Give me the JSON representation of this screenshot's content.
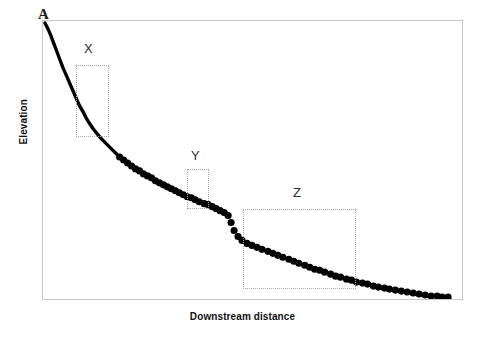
{
  "figure": {
    "panel_label": "A",
    "width": 485,
    "height": 337,
    "background_color": "#ffffff",
    "frame_color": "#c9c9c9"
  },
  "axes": {
    "x_title": "Downstream distance",
    "y_title": "Elevation"
  },
  "annotations": {
    "boxes": [
      {
        "label": "X",
        "x": 75,
        "y": 64,
        "width": 33,
        "height": 72,
        "label_x": 83,
        "label_y": 41
      },
      {
        "label": "Y",
        "x": 186,
        "y": 168,
        "width": 22,
        "height": 40,
        "label_x": 190,
        "label_y": 148
      },
      {
        "label": "Z",
        "x": 242,
        "y": 208,
        "width": 113,
        "height": 80,
        "label_x": 292,
        "label_y": 185
      }
    ],
    "box_line_color": "#a8a8a8",
    "box_line_style": "dotted"
  },
  "chart_data": {
    "type": "line",
    "title": "",
    "subtitle": "",
    "xlabel": "Downstream distance",
    "ylabel": "Elevation",
    "xlim": [
      0,
      421
    ],
    "ylim": [
      0,
      280
    ],
    "grid": false,
    "legend": null,
    "axis_ticks": {
      "x": [],
      "y": []
    },
    "marker_color": "#000000",
    "line_color": "#000000",
    "marker_size": 3.6,
    "line_width": 3.4,
    "solid_segment": {
      "style": "solid-line",
      "points": [
        [
          2,
          2
        ],
        [
          5,
          8
        ],
        [
          8,
          15
        ],
        [
          11,
          23
        ],
        [
          14,
          31
        ],
        [
          17,
          39
        ],
        [
          20,
          47
        ],
        [
          24,
          56
        ],
        [
          27,
          63
        ],
        [
          30,
          70
        ],
        [
          33,
          77
        ],
        [
          36,
          84
        ],
        [
          40,
          91
        ],
        [
          43,
          97
        ],
        [
          46,
          102
        ],
        [
          50,
          108
        ],
        [
          54,
          113
        ],
        [
          58,
          118
        ],
        [
          62,
          122
        ],
        [
          66,
          126
        ],
        [
          70,
          130
        ],
        [
          74,
          134
        ]
      ]
    },
    "dotted_segment": {
      "style": "markers",
      "points": [
        [
          77,
          137
        ],
        [
          81,
          140
        ],
        [
          85,
          143
        ],
        [
          89,
          146
        ],
        [
          93,
          149
        ],
        [
          97,
          151
        ],
        [
          101,
          154
        ],
        [
          105,
          156
        ],
        [
          109,
          158
        ],
        [
          113,
          161
        ],
        [
          117,
          163
        ],
        [
          121,
          165
        ],
        [
          125,
          167
        ],
        [
          129,
          169
        ],
        [
          133,
          171
        ],
        [
          137,
          173
        ],
        [
          141,
          175
        ],
        [
          145,
          177
        ],
        [
          149,
          178
        ],
        [
          153,
          180
        ],
        [
          157,
          182
        ],
        [
          162,
          184
        ],
        [
          166,
          185
        ],
        [
          170,
          187
        ],
        [
          174,
          189
        ],
        [
          178,
          191
        ],
        [
          182,
          193
        ],
        [
          186,
          196
        ],
        [
          189,
          203
        ],
        [
          192,
          211
        ],
        [
          196,
          217
        ],
        [
          200,
          221
        ],
        [
          205,
          224
        ],
        [
          210,
          226
        ],
        [
          215,
          228
        ],
        [
          220,
          230
        ],
        [
          226,
          232
        ],
        [
          231,
          234
        ],
        [
          236,
          236
        ],
        [
          241,
          238
        ],
        [
          247,
          240
        ],
        [
          252,
          242
        ],
        [
          257,
          244
        ],
        [
          263,
          246
        ],
        [
          268,
          248
        ],
        [
          273,
          250
        ],
        [
          278,
          251
        ],
        [
          283,
          253
        ],
        [
          289,
          255
        ],
        [
          294,
          257
        ],
        [
          299,
          258
        ],
        [
          305,
          260
        ],
        [
          310,
          261
        ],
        [
          315,
          263
        ],
        [
          321,
          264
        ],
        [
          326,
          265
        ],
        [
          332,
          267
        ],
        [
          337,
          268
        ],
        [
          343,
          269
        ],
        [
          348,
          270
        ],
        [
          354,
          271
        ],
        [
          360,
          272
        ],
        [
          366,
          273
        ],
        [
          372,
          274
        ],
        [
          378,
          275
        ],
        [
          384,
          276
        ],
        [
          390,
          277
        ],
        [
          396,
          277
        ],
        [
          401,
          278
        ],
        [
          407,
          278
        ]
      ]
    }
  }
}
